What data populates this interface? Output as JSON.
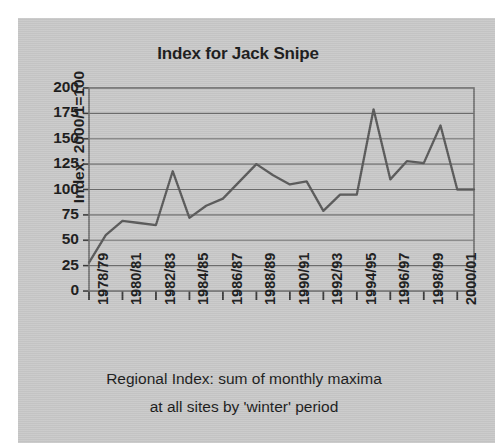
{
  "figure": {
    "background_color": "#c9c9c9",
    "outer_background_color": "#ffffff",
    "title": "Index for Jack Snipe"
  },
  "axes": {
    "y_axis_label": "Index: 2000/1=100",
    "y_ticks": [
      "200",
      "175",
      "150",
      "125",
      "100",
      "75",
      "50",
      "25",
      "0"
    ],
    "x_ticks": [
      "1978/79",
      "1980/81",
      "1982/83",
      "1984/85",
      "1986/87",
      "1988/89",
      "1990/91",
      "1992/93",
      "1994/95",
      "1996/97",
      "1998/99",
      "2000/01"
    ]
  },
  "caption": {
    "line1": "Regional Index: sum of monthly maxima",
    "line2": "at all sites by 'winter' period"
  },
  "chart_data": {
    "type": "line",
    "title": "Index for Jack Snipe",
    "xlabel": "Regional Index: sum of monthly maxima at all sites by 'winter' period",
    "ylabel": "Index: 2000/1=100",
    "ylim": [
      0,
      200
    ],
    "ytick_values": [
      0,
      25,
      50,
      75,
      100,
      125,
      150,
      175,
      200
    ],
    "grid": true,
    "legend": false,
    "line_color": "#5a5a5a",
    "categories": [
      "1978/79",
      "1979/80",
      "1980/81",
      "1981/82",
      "1982/83",
      "1983/84",
      "1984/85",
      "1985/86",
      "1986/87",
      "1987/88",
      "1988/89",
      "1989/90",
      "1990/91",
      "1991/92",
      "1992/93",
      "1993/94",
      "1994/95",
      "1995/96",
      "1996/97",
      "1997/98",
      "1998/99",
      "1999/00",
      "2000/01",
      "2001/02"
    ],
    "x_tick_labels_shown": [
      "1978/79",
      "1980/81",
      "1982/83",
      "1984/85",
      "1986/87",
      "1988/89",
      "1990/91",
      "1992/93",
      "1994/95",
      "1996/97",
      "1998/99",
      "2000/01"
    ],
    "values": [
      28,
      55,
      69,
      67,
      65,
      118,
      72,
      84,
      91,
      108,
      125,
      114,
      105,
      108,
      79,
      95,
      95,
      179,
      110,
      128,
      126,
      163,
      100,
      100
    ]
  }
}
